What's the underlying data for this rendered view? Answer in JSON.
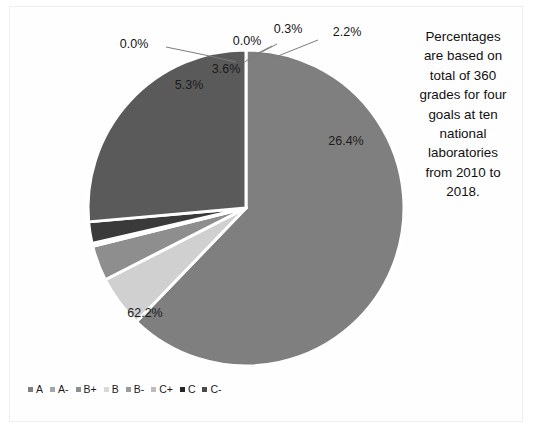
{
  "chart_data": {
    "type": "pie",
    "title": "",
    "categories": [
      "A",
      "A-",
      "B+",
      "B",
      "B-",
      "C+",
      "C",
      "C-"
    ],
    "values": [
      0.0,
      0.0,
      5.3,
      3.6,
      0.0,
      0.3,
      2.2,
      26.4
    ],
    "note": "Largest slice shown as 62.2% corresponds to the first category A; slices are drawn clockwise from 12 o'clock.",
    "slices": [
      {
        "label": "A",
        "percent": 62.2,
        "display": "62.2%",
        "color": "#7f7f7f",
        "label_position": "inside"
      },
      {
        "label": "A-",
        "percent": 0.0,
        "display": "0.0%",
        "color": "#a6a6a6",
        "label_position": "outside-left"
      },
      {
        "label": "B+",
        "percent": 5.3,
        "display": "5.3%",
        "color": "#d0d0d0",
        "label_position": "inside"
      },
      {
        "label": "B",
        "percent": 3.6,
        "display": "3.6%",
        "color": "#8e8e8e",
        "label_position": "inside"
      },
      {
        "label": "B-",
        "percent": 0.0,
        "display": "0.0%",
        "color": "#9a9a9a",
        "label_position": "outside-center"
      },
      {
        "label": "C+",
        "percent": 0.3,
        "display": "0.3%",
        "color": "#bcbcbc",
        "label_position": "outside-center-right"
      },
      {
        "label": "C",
        "percent": 2.2,
        "display": "2.2%",
        "color": "#3a3a3a",
        "label_position": "outside-right"
      },
      {
        "label": "C-",
        "percent": 26.4,
        "display": "26.4%",
        "color": "#5a5a5a",
        "label_position": "inside"
      }
    ],
    "legend_position": "bottom-left",
    "separator_color": "#ffffff",
    "background": "#ffffff"
  },
  "labels": {
    "zero_left": "0.0%",
    "zero_center": "0.0%",
    "three_tenths": "0.3%",
    "two_two": "2.2%",
    "three_six": "3.6%",
    "five_three": "5.3%",
    "twenty_six_four": "26.4%",
    "sixty_two_two": "62.2%"
  },
  "sidenote": {
    "text": "Percentages\nare based on\ntotal of 360\ngrades for four\ngoals at ten\nnational\nlaboratories\nfrom 2010 to\n2018."
  },
  "legend": {
    "items": [
      {
        "label": "A",
        "color": "#7f7f7f"
      },
      {
        "label": "A-",
        "color": "#a6a6a6"
      },
      {
        "label": "B+",
        "color": "#8e8e8e"
      },
      {
        "label": "B",
        "color": "#d8d8d8"
      },
      {
        "label": "B-",
        "color": "#9a9a9a"
      },
      {
        "label": "C+",
        "color": "#bcbcbc"
      },
      {
        "label": "C",
        "color": "#262626"
      },
      {
        "label": "C-",
        "color": "#4a4a4a"
      }
    ]
  }
}
